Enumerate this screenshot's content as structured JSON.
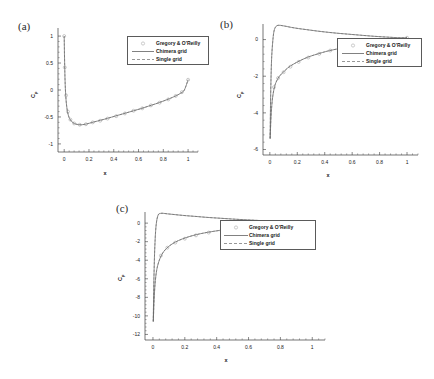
{
  "figure": {
    "panels": [
      {
        "tag": "(a)"
      },
      {
        "tag": "(b)"
      },
      {
        "tag": "(c)"
      }
    ],
    "legend": {
      "entries": [
        {
          "label": "Gregory & O'Reilly",
          "style": "marker-circle"
        },
        {
          "label": "Chimera grid",
          "style": "solid-line"
        },
        {
          "label": "Single grid",
          "style": "dashed-line"
        }
      ]
    },
    "axis_titles": {
      "x": "x",
      "y": "Cp"
    }
  },
  "chart_data": [
    {
      "type": "line",
      "panel": "(a)",
      "title": "",
      "xlabel": "x",
      "ylabel": "Cp",
      "xlim": [
        -0.05,
        1.08
      ],
      "ylim": [
        1.15,
        -1.15
      ],
      "y_inverted": true,
      "xticks": [
        0,
        0.2,
        0.4,
        0.6,
        0.8,
        1
      ],
      "xticklabels": [
        "0",
        "0.2",
        "0.4",
        "0.6",
        "0.8",
        "1"
      ],
      "yticks": [
        -1,
        -0.5,
        0,
        0.5,
        1
      ],
      "yticklabels": [
        "-1",
        "-0.5",
        "0",
        "0.5",
        "1"
      ],
      "grid": false,
      "legend_position": "upper-right",
      "series": [
        {
          "name": "Chimera grid",
          "style": "solid-line",
          "x": [
            0,
            0.004,
            0.01,
            0.02,
            0.035,
            0.055,
            0.08,
            0.11,
            0.14,
            0.18,
            0.22,
            0.27,
            0.32,
            0.38,
            0.44,
            0.5,
            0.56,
            0.62,
            0.68,
            0.74,
            0.8,
            0.85,
            0.9,
            0.94,
            0.97,
            1.0
          ],
          "y": [
            1.0,
            0.45,
            0.0,
            -0.3,
            -0.48,
            -0.57,
            -0.62,
            -0.64,
            -0.645,
            -0.63,
            -0.605,
            -0.575,
            -0.545,
            -0.505,
            -0.465,
            -0.425,
            -0.385,
            -0.345,
            -0.3,
            -0.255,
            -0.205,
            -0.16,
            -0.11,
            -0.06,
            0.0,
            0.19
          ]
        },
        {
          "name": "Single grid",
          "style": "dashed-line",
          "x": [
            0,
            0.004,
            0.01,
            0.02,
            0.035,
            0.055,
            0.08,
            0.11,
            0.14,
            0.18,
            0.22,
            0.27,
            0.32,
            0.38,
            0.44,
            0.5,
            0.56,
            0.62,
            0.68,
            0.74,
            0.8,
            0.85,
            0.9,
            0.94,
            0.97,
            1.0
          ],
          "y": [
            1.0,
            0.45,
            0.0,
            -0.3,
            -0.48,
            -0.57,
            -0.62,
            -0.64,
            -0.645,
            -0.63,
            -0.605,
            -0.575,
            -0.545,
            -0.505,
            -0.465,
            -0.425,
            -0.385,
            -0.345,
            -0.3,
            -0.255,
            -0.205,
            -0.16,
            -0.11,
            -0.06,
            0.0,
            0.19
          ]
        },
        {
          "name": "Gregory & O'Reilly",
          "style": "marker-circle",
          "x": [
            0.0,
            0.005,
            0.015,
            0.03,
            0.05,
            0.08,
            0.125,
            0.175,
            0.23,
            0.29,
            0.35,
            0.42,
            0.49,
            0.56,
            0.63,
            0.7,
            0.77,
            0.84,
            0.9,
            0.95,
            1.0
          ],
          "y": [
            1.0,
            0.42,
            -0.1,
            -0.4,
            -0.55,
            -0.62,
            -0.645,
            -0.635,
            -0.6,
            -0.57,
            -0.53,
            -0.485,
            -0.435,
            -0.385,
            -0.34,
            -0.285,
            -0.235,
            -0.175,
            -0.11,
            -0.04,
            0.19
          ]
        }
      ]
    },
    {
      "type": "line",
      "panel": "(b)",
      "title": "",
      "xlabel": "x",
      "ylabel": "Cp",
      "xlim": [
        -0.05,
        1.08
      ],
      "ylim": [
        0.85,
        -6.3
      ],
      "y_inverted": true,
      "xticks": [
        0,
        0.2,
        0.4,
        0.6,
        0.8,
        1
      ],
      "xticklabels": [
        "0",
        "0.2",
        "0.4",
        "0.6",
        "0.8",
        "1"
      ],
      "yticks": [
        -6,
        -4,
        -2,
        0
      ],
      "yticklabels": [
        "-6",
        "-4",
        "-2",
        "0"
      ],
      "grid": false,
      "legend_position": "upper-right",
      "series": [
        {
          "name": "Chimera grid upper surface",
          "style": "solid-line",
          "x": [
            0.002,
            0.004,
            0.008,
            0.014,
            0.022,
            0.035,
            0.05,
            0.07,
            0.095,
            0.13,
            0.17,
            0.22,
            0.28,
            0.35,
            0.42,
            0.5,
            0.58,
            0.66,
            0.74,
            0.82,
            0.89,
            0.94,
            0.97,
            1.0
          ],
          "y": [
            -5.4,
            -5.0,
            -4.3,
            -3.6,
            -3.05,
            -2.55,
            -2.25,
            -2.0,
            -1.8,
            -1.55,
            -1.35,
            -1.15,
            -0.95,
            -0.78,
            -0.63,
            -0.5,
            -0.4,
            -0.3,
            -0.22,
            -0.14,
            -0.08,
            -0.04,
            -0.01,
            0.1
          ]
        },
        {
          "name": "Chimera grid lower surface",
          "style": "solid-line",
          "x": [
            0.002,
            0.006,
            0.012,
            0.02,
            0.03,
            0.045,
            0.065,
            0.09,
            0.12,
            0.16,
            0.21,
            0.27,
            0.34,
            0.42,
            0.5,
            0.58,
            0.66,
            0.74,
            0.82,
            0.89,
            0.94,
            0.97,
            1.0
          ],
          "y": [
            -5.4,
            -3.0,
            -1.2,
            -0.2,
            0.45,
            0.72,
            0.78,
            0.76,
            0.72,
            0.66,
            0.6,
            0.54,
            0.47,
            0.4,
            0.34,
            0.29,
            0.24,
            0.19,
            0.15,
            0.12,
            0.1,
            0.1,
            0.1
          ]
        },
        {
          "name": "Single grid upper surface",
          "style": "dashed-line",
          "x": [
            0.002,
            0.004,
            0.008,
            0.014,
            0.022,
            0.035,
            0.05,
            0.07,
            0.095,
            0.13,
            0.17,
            0.22,
            0.28,
            0.35,
            0.42,
            0.5,
            0.58,
            0.66,
            0.74,
            0.82,
            0.89,
            0.94,
            0.97,
            1.0
          ],
          "y": [
            -5.4,
            -5.0,
            -4.3,
            -3.6,
            -3.05,
            -2.55,
            -2.25,
            -2.0,
            -1.8,
            -1.55,
            -1.35,
            -1.15,
            -0.95,
            -0.78,
            -0.63,
            -0.5,
            -0.4,
            -0.3,
            -0.22,
            -0.14,
            -0.08,
            -0.04,
            -0.01,
            0.1
          ]
        },
        {
          "name": "Single grid lower surface",
          "style": "dashed-line",
          "x": [
            0.002,
            0.006,
            0.012,
            0.02,
            0.03,
            0.045,
            0.065,
            0.09,
            0.12,
            0.16,
            0.21,
            0.27,
            0.34,
            0.42,
            0.5,
            0.58,
            0.66,
            0.74,
            0.82,
            0.89,
            0.94,
            0.97,
            1.0
          ],
          "y": [
            -5.4,
            -3.0,
            -1.2,
            -0.2,
            0.45,
            0.72,
            0.78,
            0.76,
            0.72,
            0.66,
            0.6,
            0.54,
            0.47,
            0.4,
            0.34,
            0.29,
            0.24,
            0.19,
            0.15,
            0.12,
            0.1,
            0.1,
            0.1
          ]
        },
        {
          "name": "Gregory & O'Reilly",
          "style": "marker-circle",
          "x": [
            0.03,
            0.06,
            0.1,
            0.15,
            0.21,
            0.28,
            0.36,
            0.44,
            0.52,
            0.6,
            0.68,
            0.76,
            0.84,
            0.9,
            0.95,
            1.0
          ],
          "y": [
            -2.6,
            -2.1,
            -1.78,
            -1.48,
            -1.22,
            -0.98,
            -0.78,
            -0.6,
            -0.47,
            -0.36,
            -0.27,
            -0.19,
            -0.11,
            -0.06,
            -0.02,
            0.1
          ]
        }
      ]
    },
    {
      "type": "line",
      "panel": "(c)",
      "title": "",
      "xlabel": "x",
      "ylabel": "Cp",
      "xlim": [
        -0.05,
        1.08
      ],
      "ylim": [
        1.2,
        -12.6
      ],
      "y_inverted": true,
      "xticks": [
        0,
        0.2,
        0.4,
        0.6,
        0.8,
        1
      ],
      "xticklabels": [
        "0",
        "0.2",
        "0.4",
        "0.6",
        "0.8",
        "1"
      ],
      "yticks": [
        -12,
        -10,
        -8,
        -6,
        -4,
        -2,
        0
      ],
      "yticklabels": [
        "-12",
        "-10",
        "-8",
        "-6",
        "-4",
        "-2",
        "0"
      ],
      "grid": false,
      "legend_position": "upper-right",
      "series": [
        {
          "name": "Chimera grid upper surface",
          "style": "solid-line",
          "x": [
            0.002,
            0.005,
            0.009,
            0.015,
            0.023,
            0.034,
            0.048,
            0.066,
            0.09,
            0.12,
            0.16,
            0.21,
            0.27,
            0.34,
            0.42,
            0.5,
            0.58,
            0.66,
            0.74,
            0.82,
            0.88,
            0.93,
            0.97,
            1.0
          ],
          "y": [
            -10.6,
            -9.2,
            -7.6,
            -6.2,
            -5.1,
            -4.3,
            -3.65,
            -3.1,
            -2.65,
            -2.25,
            -1.88,
            -1.55,
            -1.25,
            -1.0,
            -0.78,
            -0.6,
            -0.45,
            -0.33,
            -0.24,
            -0.16,
            -0.11,
            -0.07,
            -0.04,
            -0.02
          ]
        },
        {
          "name": "Chimera grid lower surface",
          "style": "solid-line",
          "x": [
            0.002,
            0.006,
            0.012,
            0.02,
            0.032,
            0.048,
            0.068,
            0.092,
            0.12,
            0.16,
            0.21,
            0.27,
            0.34,
            0.42,
            0.5,
            0.58,
            0.66,
            0.74,
            0.82,
            0.88,
            0.93,
            0.97,
            1.0
          ],
          "y": [
            -10.6,
            -6.0,
            -2.4,
            -0.2,
            0.85,
            1.05,
            1.05,
            1.0,
            0.95,
            0.88,
            0.8,
            0.72,
            0.62,
            0.53,
            0.44,
            0.36,
            0.29,
            0.22,
            0.15,
            0.1,
            0.06,
            0.02,
            -0.02
          ]
        },
        {
          "name": "Single grid upper surface",
          "style": "dashed-line",
          "x": [
            0.002,
            0.005,
            0.009,
            0.015,
            0.023,
            0.034,
            0.048,
            0.066,
            0.09,
            0.12,
            0.16,
            0.21,
            0.27,
            0.34,
            0.42,
            0.5,
            0.58,
            0.66,
            0.74,
            0.82,
            0.88,
            0.93,
            0.97,
            1.0
          ],
          "y": [
            -10.6,
            -9.2,
            -7.6,
            -6.2,
            -5.1,
            -4.3,
            -3.65,
            -3.1,
            -2.65,
            -2.25,
            -1.88,
            -1.55,
            -1.25,
            -1.0,
            -0.78,
            -0.6,
            -0.45,
            -0.33,
            -0.24,
            -0.16,
            -0.11,
            -0.07,
            -0.04,
            -0.02
          ]
        },
        {
          "name": "Single grid lower surface",
          "style": "dashed-line",
          "x": [
            0.002,
            0.006,
            0.012,
            0.02,
            0.032,
            0.048,
            0.068,
            0.092,
            0.12,
            0.16,
            0.21,
            0.27,
            0.34,
            0.42,
            0.5,
            0.58,
            0.66,
            0.74,
            0.82,
            0.88,
            0.93,
            0.97,
            1.0
          ],
          "y": [
            -10.6,
            -6.0,
            -2.4,
            -0.2,
            0.85,
            1.05,
            1.05,
            1.0,
            0.95,
            0.88,
            0.8,
            0.72,
            0.62,
            0.53,
            0.44,
            0.36,
            0.29,
            0.22,
            0.15,
            0.1,
            0.06,
            0.02,
            -0.02
          ]
        },
        {
          "name": "Gregory & O'Reilly",
          "style": "marker-circle",
          "x": [
            0.05,
            0.09,
            0.14,
            0.2,
            0.27,
            0.35,
            0.43,
            0.51,
            0.59,
            0.67,
            0.75,
            0.82,
            0.88,
            0.93,
            0.97,
            1.0
          ],
          "y": [
            -3.5,
            -2.65,
            -2.1,
            -1.68,
            -1.32,
            -1.02,
            -0.8,
            -0.62,
            -0.47,
            -0.35,
            -0.25,
            -0.17,
            -0.11,
            -0.07,
            -0.04,
            -0.02
          ]
        }
      ]
    }
  ]
}
